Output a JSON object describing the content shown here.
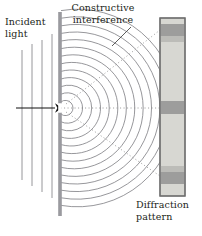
{
  "figure": {
    "title_implicit": "Single-slit diffraction",
    "labels": {
      "incident_light": "Incident\nlight",
      "constructive_interference": "Constructive\ninterference",
      "diffraction_pattern": "Diffraction\npattern"
    },
    "colors": {
      "text": "#231f20",
      "wave_stroke": "#6f6f75",
      "barrier": "#9a9a9f",
      "screen_fill": "#d7d7d2",
      "screen_border": "#6e6e6e",
      "fringe_dark": "#9d9d9c",
      "fringe_mid": "#b9b9b5",
      "arrow": "#111111",
      "dotted_ray": "#8a8a8a",
      "leader": "#4a4a4a"
    },
    "geometry": {
      "barrier_x": 60,
      "barrier_top": 12,
      "barrier_bottom": 216,
      "slit_y": 108,
      "slit_height": 9,
      "screen_x": 160,
      "screen_y": 18,
      "screen_width": 25,
      "screen_height": 178,
      "wave_arc_count": 13,
      "wave_arc_spacing": 7.6,
      "incident_wavefronts": 4
    },
    "incident_wavefronts_x": [
      22,
      32,
      42,
      52
    ],
    "fringes": [
      {
        "name": "upper-order-fringe",
        "y": 24,
        "height": 12,
        "shade": "fringe_dark"
      },
      {
        "name": "upper-faint-fringe",
        "y": 36,
        "height": 6,
        "shade": "fringe_mid"
      },
      {
        "name": "central-maximum",
        "y": 101,
        "height": 13,
        "shade": "fringe_dark"
      },
      {
        "name": "lower-faint-fringe",
        "y": 166,
        "height": 6,
        "shade": "fringe_mid"
      },
      {
        "name": "lower-order-fringe",
        "y": 172,
        "height": 12,
        "shade": "fringe_dark"
      }
    ],
    "rays": [
      {
        "name": "upper-ray",
        "x1": 66,
        "y1": 104,
        "x2": 161,
        "y2": 30
      },
      {
        "name": "central-ray",
        "x1": 64,
        "y1": 108,
        "x2": 161,
        "y2": 108
      },
      {
        "name": "lower-ray",
        "x1": 66,
        "y1": 112,
        "x2": 161,
        "y2": 176
      }
    ],
    "leader_line": {
      "name": "constructive-leader",
      "x1": 131,
      "y1": 28,
      "x2": 112,
      "y2": 46
    }
  }
}
